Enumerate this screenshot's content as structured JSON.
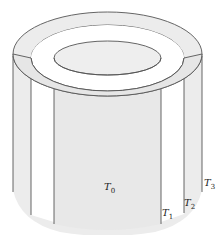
{
  "diagram": {
    "type": "concentric-cylinders",
    "colors": {
      "fill_light": "#ececec",
      "fill_mid": "#e4e4e4",
      "stroke": "#555555",
      "background": "#ffffff"
    },
    "labels": [
      {
        "id": "T0",
        "main": "T",
        "sub": "0",
        "x": 104,
        "y": 190
      },
      {
        "id": "T1",
        "main": "T",
        "sub": "1",
        "x": 162,
        "y": 216
      },
      {
        "id": "T2",
        "main": "T",
        "sub": "2",
        "x": 184,
        "y": 206
      },
      {
        "id": "T3",
        "main": "T",
        "sub": "3",
        "x": 204,
        "y": 186
      }
    ]
  }
}
